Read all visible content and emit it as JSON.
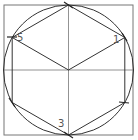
{
  "diagram": {
    "title": "",
    "type": "geometric-construction",
    "colors": {
      "stroke": "#333333",
      "guide": "#777777",
      "label": "#555555",
      "background": "#ffffff"
    },
    "square": {
      "x": 4,
      "y": 5,
      "width": 129,
      "height": 130
    },
    "circle": {
      "cx": 68.5,
      "cy": 70,
      "r": 65
    },
    "center_lines": {
      "vertical": {
        "x": 68.5,
        "y1": 5,
        "y2": 135
      },
      "horizontal": {
        "y": 70,
        "x1": 4,
        "x2": 133
      }
    },
    "vertices": [
      {
        "id": "top",
        "x": 68.5,
        "y": 5,
        "label": ""
      },
      {
        "id": "1",
        "x": 124.8,
        "y": 37.5,
        "label": "1"
      },
      {
        "id": "lower-right",
        "x": 124.8,
        "y": 102.5,
        "label": ""
      },
      {
        "id": "3",
        "x": 68.5,
        "y": 135,
        "label": "3"
      },
      {
        "id": "lower-left",
        "x": 12.2,
        "y": 102.5,
        "label": ""
      },
      {
        "id": "5",
        "x": 12.2,
        "y": 37.5,
        "label": "5"
      }
    ],
    "labels": [
      {
        "text": "5",
        "x": 17,
        "y": 33
      },
      {
        "text": "1",
        "x": 114,
        "y": 35
      },
      {
        "text": "3",
        "x": 58,
        "y": 119
      }
    ]
  }
}
